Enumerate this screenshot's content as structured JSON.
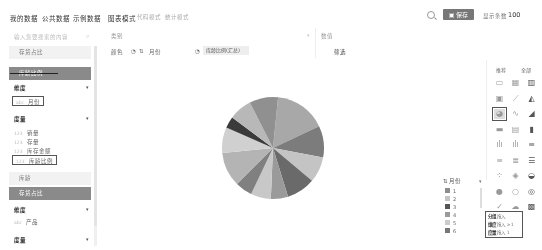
{
  "topnav": {
    "tabs": [
      {
        "label": "我的数据",
        "active": true
      },
      {
        "label": "公共数据",
        "active": false
      },
      {
        "label": "示例数据",
        "active": false
      }
    ],
    "modes": [
      {
        "label": "图表模式",
        "active": true
      },
      {
        "label": "代码模式",
        "active": false
      },
      {
        "label": "统计模式",
        "active": false
      }
    ],
    "save_label": "保存",
    "show_rows_label": "显示条数",
    "show_rows_value": "100"
  },
  "left_panel": {
    "search_placeholder": "输入您要搜索的内容",
    "tables": [
      {
        "label": "存货占比",
        "active": false
      },
      {
        "label": "库龄比例",
        "active": true
      }
    ],
    "groups_table1": {
      "dimension_label": "维度",
      "dimension_fields": [
        {
          "type": "abc",
          "label": "月份"
        }
      ],
      "measure_label": "度量",
      "measure_fields": [
        {
          "type": "123",
          "label": "销量"
        },
        {
          "type": "123",
          "label": "存量"
        },
        {
          "type": "123",
          "label": "库存金额"
        },
        {
          "type": "123",
          "label": "库龄比例"
        }
      ]
    },
    "tables_more": [
      {
        "label": "库龄",
        "active": false
      },
      {
        "label": "存货占比",
        "active": true
      }
    ],
    "groups_table2": {
      "dimension_label": "维度",
      "dimension_fields": [
        {
          "type": "abc",
          "label": "产品"
        }
      ],
      "measure_label": "度量"
    }
  },
  "toolbar": {
    "category_label": "类别",
    "value_label": "数值",
    "color_label": "颜色",
    "color_field": "月份",
    "measure_chip": "库龄比例(汇总)",
    "filter_label": "筛选"
  },
  "chart_data": {
    "type": "pie",
    "title": "",
    "categories": [
      "1",
      "2",
      "3",
      "4",
      "5",
      "6",
      "7",
      "8",
      "9",
      "10",
      "11",
      "12"
    ],
    "values": [
      18,
      11,
      9,
      10,
      6,
      7,
      6,
      12,
      9,
      4,
      8,
      10
    ],
    "colors": [
      "#a8a8a8",
      "#7c7c7c",
      "#c4c4c4",
      "#6a6a6a",
      "#9a9a9a",
      "#c8c8c8",
      "#808080",
      "#b4b4b4",
      "#d0d0d0",
      "#3a3a3a",
      "#b8b8b8",
      "#909090"
    ],
    "legend_position": "right",
    "legend_title": "月份"
  },
  "legend": {
    "title": "月份",
    "items": [
      {
        "label": "1",
        "color": "#8c8c8c"
      },
      {
        "label": "2",
        "color": "#c4c4c4"
      },
      {
        "label": "3",
        "color": "#555555"
      },
      {
        "label": "4",
        "color": "#9a9a9a"
      },
      {
        "label": "5",
        "color": "#cccccc"
      },
      {
        "label": "6",
        "color": "#777777"
      }
    ]
  },
  "right_panel": {
    "tabs": [
      {
        "label": "推荐"
      },
      {
        "label": "全部"
      }
    ],
    "chart_types": [
      "table-icon",
      "cross-table-icon",
      "bar-table-icon",
      "kpi-icon",
      "line-icon",
      "area-icon",
      "pie-icon",
      "multi-line-icon",
      "stacked-area-icon",
      "bar-icon",
      "grouped-bar-icon",
      "column-icon",
      "multi-column-icon",
      "stacked-column-icon",
      "horizontal-bar-icon",
      "horizontal-group-icon",
      "horizontal-stack-icon",
      "horizontal-full-icon",
      "scatter-icon",
      "map-icon",
      "funnel-icon",
      "gauge-icon",
      "ring-icon",
      "donut-icon",
      "radar-icon",
      "wordcloud-icon",
      "treemap-icon"
    ],
    "selected_index": 6,
    "hints": [
      {
        "key": "分组",
        "value": "拖入"
      },
      {
        "key": "维度",
        "value": "拖入 ≥1"
      },
      {
        "key": "度量",
        "value": "拖入 1"
      }
    ]
  }
}
